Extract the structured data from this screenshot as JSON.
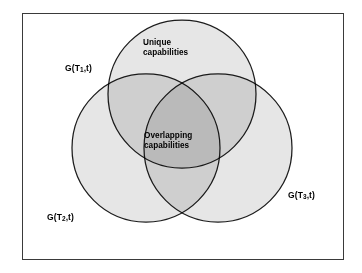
{
  "diagram": {
    "type": "venn-3-set",
    "title": "",
    "frame": {
      "border_color": "#3a3a3a",
      "background": "#ffffff"
    },
    "colors": {
      "circle_fill": "#e6e6e6",
      "circle_stroke": "#1c1c1c",
      "text": "#000000"
    },
    "sets": [
      {
        "id": "t1",
        "label_prefix": "G(T",
        "label_sub": "1",
        "label_suffix": ",t)",
        "label_full": "G(T1,t)",
        "position": "top"
      },
      {
        "id": "t2",
        "label_prefix": "G(T",
        "label_sub": "2",
        "label_suffix": ",t)",
        "label_full": "G(T2,t)",
        "position": "bottom-left"
      },
      {
        "id": "t3",
        "label_prefix": "G(T",
        "label_sub": "3",
        "label_suffix": ",t)",
        "label_full": "G(T3,t)",
        "position": "bottom-right"
      }
    ],
    "regions": [
      {
        "id": "unique",
        "line1": "Unique",
        "line2": "capabilities",
        "describes": "exclusive-area-of-top-circle"
      },
      {
        "id": "overlapping",
        "line1": "Overlapping",
        "line2": "capabilities",
        "describes": "triple-intersection-of-all-three-circles"
      }
    ]
  }
}
